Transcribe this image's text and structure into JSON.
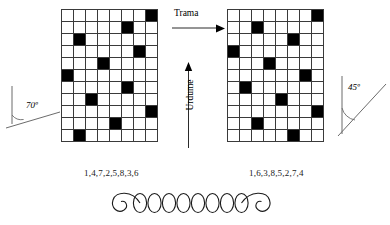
{
  "figure": {
    "title_present": false,
    "background_color": "#ffffff",
    "line_color": "#3a3a3a",
    "fill_color": "#000000"
  },
  "weave_left": {
    "name": "left-weave-diagram",
    "columns": 8,
    "rows": 11,
    "cell_size_px": 12,
    "sequence_label": "1,4,7,2,5,8,3,6",
    "filled_cells_by_row": [
      8,
      6,
      2,
      7,
      4,
      1,
      6,
      3,
      8,
      5,
      2
    ]
  },
  "weave_right": {
    "name": "right-weave-diagram",
    "columns": 8,
    "rows": 11,
    "cell_size_px": 12,
    "sequence_label": "1,6,3,8,5,2,7,4",
    "filled_cells_by_row": [
      8,
      3,
      6,
      1,
      4,
      7,
      2,
      5,
      8,
      3,
      6
    ]
  },
  "axes": {
    "weft_label": "Trama",
    "warp_label": "Urdume"
  },
  "angles": {
    "left_value": "70º",
    "right_value": "45º"
  },
  "yarn": {
    "name": "yarn-loop-chain",
    "loop_count": 8
  },
  "chart_data": {
    "type": "heatmap",
    "title": "",
    "xlabel": "Trama",
    "ylabel": "Urdume",
    "grid": true,
    "legend": "none",
    "series": [
      {
        "name": "1,4,7,2,5,8,3,6",
        "angle": "70º",
        "columns": 8,
        "rows": 11,
        "matrix": [
          [
            0,
            0,
            0,
            0,
            0,
            0,
            0,
            1
          ],
          [
            0,
            0,
            0,
            0,
            0,
            1,
            0,
            0
          ],
          [
            0,
            1,
            0,
            0,
            0,
            0,
            0,
            0
          ],
          [
            0,
            0,
            0,
            0,
            0,
            0,
            1,
            0
          ],
          [
            0,
            0,
            0,
            1,
            0,
            0,
            0,
            0
          ],
          [
            1,
            0,
            0,
            0,
            0,
            0,
            0,
            0
          ],
          [
            0,
            0,
            0,
            0,
            0,
            1,
            0,
            0
          ],
          [
            0,
            0,
            1,
            0,
            0,
            0,
            0,
            0
          ],
          [
            0,
            0,
            0,
            0,
            0,
            0,
            0,
            1
          ],
          [
            0,
            0,
            0,
            0,
            1,
            0,
            0,
            0
          ],
          [
            0,
            1,
            0,
            0,
            0,
            0,
            0,
            0
          ]
        ]
      },
      {
        "name": "1,6,3,8,5,2,7,4",
        "angle": "45º",
        "columns": 8,
        "rows": 11,
        "matrix": [
          [
            0,
            0,
            0,
            0,
            0,
            0,
            0,
            1
          ],
          [
            0,
            0,
            1,
            0,
            0,
            0,
            0,
            0
          ],
          [
            0,
            0,
            0,
            0,
            0,
            1,
            0,
            0
          ],
          [
            1,
            0,
            0,
            0,
            0,
            0,
            0,
            0
          ],
          [
            0,
            0,
            0,
            1,
            0,
            0,
            0,
            0
          ],
          [
            0,
            0,
            0,
            0,
            0,
            0,
            1,
            0
          ],
          [
            0,
            1,
            0,
            0,
            0,
            0,
            0,
            0
          ],
          [
            0,
            0,
            0,
            0,
            1,
            0,
            0,
            0
          ],
          [
            0,
            0,
            0,
            0,
            0,
            0,
            0,
            1
          ],
          [
            0,
            0,
            1,
            0,
            0,
            0,
            0,
            0
          ],
          [
            0,
            0,
            0,
            0,
            0,
            1,
            0,
            0
          ]
        ]
      }
    ]
  }
}
